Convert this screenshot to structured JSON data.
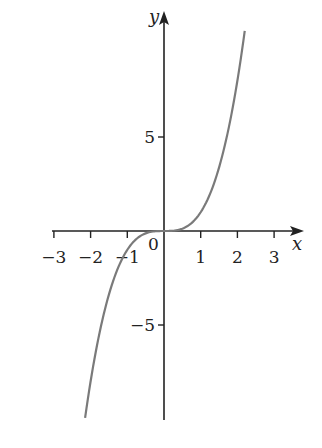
{
  "chart_data": {
    "type": "line",
    "title": "",
    "function": "y = x^3",
    "xlabel": "x",
    "ylabel": "y",
    "xlim": [
      -3.0,
      3.8
    ],
    "ylim": [
      -10.3,
      11.7
    ],
    "x_ticks": [
      -3,
      -2,
      -1,
      1,
      2,
      3
    ],
    "x_tick_labels": [
      "−3",
      "−2",
      "−1",
      "1",
      "2",
      "3"
    ],
    "y_ticks": [
      5,
      -5
    ],
    "y_tick_labels": [
      "5",
      "−5"
    ],
    "origin_label": "0",
    "grid": false,
    "legend": null,
    "series": [
      {
        "name": "y = x^3",
        "color": "#7a7a7a",
        "x": [
          -2.15,
          -2,
          -1.5,
          -1,
          -0.5,
          0,
          0.5,
          1,
          1.5,
          2,
          2.2
        ],
        "y": [
          -9.94,
          -8,
          -3.375,
          -1,
          -0.125,
          0,
          0.125,
          1,
          3.375,
          8,
          10.65
        ]
      }
    ]
  },
  "colors": {
    "axis": "#222222",
    "curve": "#7a7a7a",
    "background": "#ffffff"
  }
}
